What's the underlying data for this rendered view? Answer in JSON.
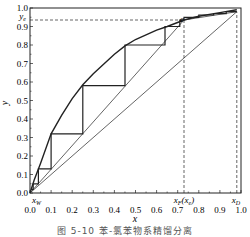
{
  "chart_data": {
    "type": "line",
    "title": "",
    "caption": "图 5-10  苯-氯苯物系精馏分离",
    "xlabel": "x",
    "ylabel": "y",
    "xlim": [
      0.0,
      1.0
    ],
    "ylim": [
      0.0,
      1.0
    ],
    "grid": false,
    "x_ticks": [
      "0.0",
      "0.1",
      "0.2",
      "0.3",
      "0.4",
      "0.5",
      "0.6",
      "0.7",
      "0.8",
      "0.9",
      "1.0"
    ],
    "y_ticks": [
      "0.0",
      "0.1",
      "0.2",
      "0.3",
      "0.4",
      "0.5",
      "0.6",
      "0.7",
      "0.8",
      "0.9",
      "1.0"
    ],
    "annotations": {
      "xW": {
        "label": "xW",
        "x": 0.0
      },
      "xF": {
        "label": "xF(xe)",
        "x": 0.73
      },
      "xD": {
        "label": "xD",
        "x": 0.98
      },
      "ye": {
        "label": "ye",
        "y": 0.935
      },
      "e": {
        "label": "e",
        "x": 0.73,
        "y": 0.935
      }
    },
    "series": [
      {
        "name": "equilibrium curve",
        "style": "thick",
        "points": [
          [
            0,
            0
          ],
          [
            0.02,
            0.07
          ],
          [
            0.05,
            0.16
          ],
          [
            0.1,
            0.32
          ],
          [
            0.15,
            0.42
          ],
          [
            0.2,
            0.51
          ],
          [
            0.25,
            0.585
          ],
          [
            0.3,
            0.645
          ],
          [
            0.4,
            0.75
          ],
          [
            0.45,
            0.795
          ],
          [
            0.5,
            0.83
          ],
          [
            0.6,
            0.88
          ],
          [
            0.65,
            0.9
          ],
          [
            0.73,
            0.935
          ],
          [
            0.8,
            0.955
          ],
          [
            0.9,
            0.975
          ],
          [
            0.98,
            0.99
          ]
        ]
      },
      {
        "name": "diagonal y=x",
        "style": "thin",
        "points": [
          [
            0,
            0
          ],
          [
            0.98,
            0.98
          ]
        ]
      },
      {
        "name": "operating line (stripping)",
        "style": "thin",
        "points": [
          [
            0,
            0
          ],
          [
            0.73,
            0.935
          ]
        ]
      },
      {
        "name": "operating line (rectifying)",
        "style": "thin",
        "points": [
          [
            0.73,
            0.935
          ],
          [
            0.98,
            0.98
          ]
        ]
      },
      {
        "name": "stage steps",
        "style": "medium",
        "points": [
          [
            0.98,
            0.98
          ],
          [
            0.93,
            0.98
          ],
          [
            0.93,
            0.97
          ],
          [
            0.87,
            0.97
          ],
          [
            0.87,
            0.962
          ],
          [
            0.8,
            0.962
          ],
          [
            0.8,
            0.95
          ],
          [
            0.73,
            0.95
          ],
          [
            0.73,
            0.935
          ],
          [
            0.71,
            0.935
          ],
          [
            0.71,
            0.9
          ],
          [
            0.64,
            0.9
          ],
          [
            0.64,
            0.8
          ],
          [
            0.45,
            0.8
          ],
          [
            0.45,
            0.58
          ],
          [
            0.25,
            0.58
          ],
          [
            0.25,
            0.32
          ],
          [
            0.1,
            0.32
          ],
          [
            0.1,
            0.13
          ],
          [
            0.04,
            0.13
          ],
          [
            0.04,
            0.05
          ],
          [
            0.015,
            0.05
          ],
          [
            0.015,
            0.02
          ],
          [
            0.005,
            0.02
          ]
        ]
      },
      {
        "name": "xF vertical",
        "style": "dashed",
        "points": [
          [
            0.73,
            0
          ],
          [
            0.73,
            0.935
          ]
        ]
      },
      {
        "name": "ye horizontal",
        "style": "dashed",
        "points": [
          [
            0,
            0.935
          ],
          [
            0.73,
            0.935
          ]
        ]
      },
      {
        "name": "xD vertical",
        "style": "dashed",
        "points": [
          [
            0.98,
            0
          ],
          [
            0.98,
            0.98
          ]
        ]
      }
    ]
  }
}
